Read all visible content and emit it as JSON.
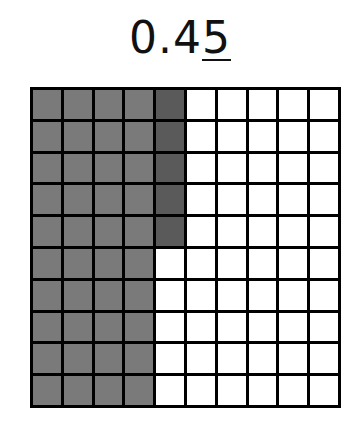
{
  "title": {
    "prefix": "0.4",
    "underlined": "5"
  },
  "grid": {
    "rows": 10,
    "cols": 10,
    "full_shaded_columns": 4,
    "partial_column": {
      "index": 4,
      "shaded_rows": 5
    },
    "colors": {
      "tenths": "#7a7a7a",
      "hundredths": "#5a5a5a",
      "empty": "#ffffff",
      "lines": "#000000"
    },
    "shaded_count": 45
  }
}
